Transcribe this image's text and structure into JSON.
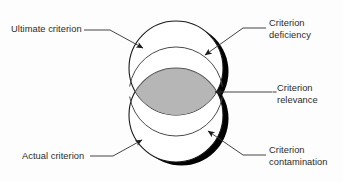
{
  "figure": {
    "type": "venn-diagram",
    "title": "",
    "background_color": "#fdfdfd",
    "shapes": {
      "ultimate_criterion_circle": {
        "name": "Ultimate criterion",
        "fill": "#ffffff",
        "stroke": "#1a1a1a",
        "center_x": 176,
        "center_y": 68,
        "radius": 47
      },
      "actual_criterion_circle": {
        "name": "Actual criterion",
        "fill": "#ffffff",
        "stroke": "#1a1a1a",
        "center_x": 176,
        "center_y": 115,
        "radius": 47
      },
      "overlap_lens": {
        "name": "Criterion relevance",
        "fill": "#b6b6b6",
        "stroke": "#555555"
      },
      "drop_shadow": {
        "color": "#000000"
      }
    }
  },
  "labels": {
    "ultimate_criterion": {
      "line1": "Ultimate criterion"
    },
    "actual_criterion": {
      "line1": "Actual criterion"
    },
    "criterion_deficiency": {
      "line1": "Criterion",
      "line2": "deficiency"
    },
    "criterion_relevance": {
      "line1": "Criterion",
      "line2": "relevance"
    },
    "criterion_contamination": {
      "line1": "Criterion",
      "line2": "contamination"
    }
  },
  "colors": {
    "text": "#2b2b2b",
    "line": "#3a3a3a",
    "overlap_gray": "#b6b6b6",
    "shadow_black": "#000000",
    "circle_outline": "#1a1a1a"
  }
}
